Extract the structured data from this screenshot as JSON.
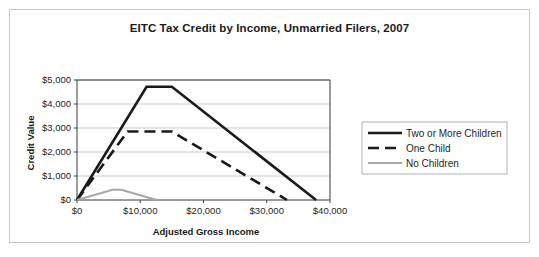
{
  "chart_data": {
    "type": "line",
    "title": "EITC Tax Credit by Income, Unmarried Filers, 2007",
    "xlabel": "Adjusted Gross Income",
    "ylabel": "Credit Value",
    "xlim": [
      0,
      40000
    ],
    "ylim": [
      0,
      5000
    ],
    "grid": true,
    "legend_position": "right",
    "xticks": [
      0,
      10000,
      20000,
      30000,
      40000
    ],
    "xtick_labels": [
      "$0",
      "$10,000",
      "$20,000",
      "$30,000",
      "$40,000"
    ],
    "yticks": [
      0,
      1000,
      2000,
      3000,
      4000,
      5000
    ],
    "ytick_labels": [
      "$0",
      "$1,000",
      "$2,000",
      "$3,000",
      "$4,000",
      "$5,000"
    ],
    "series": [
      {
        "name": "Two or More Children",
        "color": "#1a1a1a",
        "style": "solid",
        "width": 2.6,
        "points": [
          [
            0,
            0
          ],
          [
            11000,
            4716
          ],
          [
            15000,
            4716
          ],
          [
            37800,
            0
          ]
        ]
      },
      {
        "name": "One Child",
        "color": "#1a1a1a",
        "style": "dashed",
        "width": 2.6,
        "points": [
          [
            0,
            0
          ],
          [
            8000,
            2853
          ],
          [
            15000,
            2853
          ],
          [
            33200,
            0
          ]
        ]
      },
      {
        "name": "No Children",
        "color": "#a8a8a8",
        "style": "solid",
        "width": 2.2,
        "points": [
          [
            0,
            0
          ],
          [
            5600,
            428
          ],
          [
            7000,
            428
          ],
          [
            12600,
            0
          ]
        ]
      }
    ]
  },
  "legend": {
    "items": [
      {
        "label": "Two or More Children"
      },
      {
        "label": "One Child"
      },
      {
        "label": "No Children"
      }
    ]
  }
}
